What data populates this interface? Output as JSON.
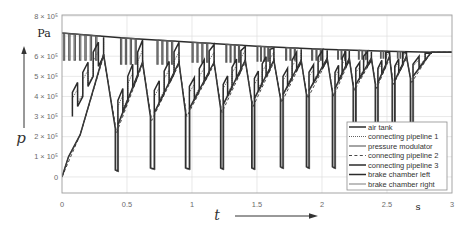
{
  "figure": {
    "y_axis": {
      "symbol": "p",
      "unit": "Pa"
    },
    "x_axis": {
      "symbol": "t",
      "unit": "s"
    }
  },
  "chart_data": {
    "type": "line",
    "title": "",
    "xlabel": "t",
    "xunit": "s",
    "ylabel": "p",
    "yunit": "Pa",
    "xlim": [
      0,
      3
    ],
    "ylim": [
      -0.8,
      8.05
    ],
    "y_multiplier": 100000,
    "xticks": [
      0,
      0.5,
      1,
      1.5,
      2,
      2.5,
      3
    ],
    "xtick_labels": [
      "0",
      "0.5",
      "1",
      "1.5",
      "2",
      "2.5",
      "3"
    ],
    "yticks": [
      0,
      1,
      2,
      3,
      4,
      5,
      6,
      7,
      8
    ],
    "ytick_labels": [
      "0",
      "1 × 10⁵",
      "2 × 10⁵",
      "3 × 10⁵",
      "4 × 10⁵",
      "5 × 10⁵",
      "6 × 10⁵",
      "",
      "8 × 10⁵"
    ],
    "grid": true,
    "legend_position": "lower right",
    "series": [
      {
        "name": "air tank",
        "line_style": "solid-thick",
        "kind": "line",
        "x": [
          0,
          0.5,
          1,
          1.5,
          2,
          2.5,
          2.85,
          3
        ],
        "y": [
          7.15,
          6.9,
          6.7,
          6.5,
          6.35,
          6.25,
          6.2,
          6.2
        ]
      },
      {
        "name": "connecting pipeline 1",
        "line_style": "dotted",
        "kind": "ladder",
        "ladders": [
          [
            0.08,
            3.2,
            0.32,
            6.0,
            6,
            0.7
          ],
          [
            0.43,
            2.8,
            0.62,
            5.6,
            5,
            0.7
          ],
          [
            0.71,
            3.4,
            0.9,
            5.6,
            5,
            0.6
          ],
          [
            0.98,
            3.6,
            1.17,
            5.6,
            5,
            0.6
          ],
          [
            1.24,
            3.8,
            1.41,
            5.7,
            5,
            0.6
          ],
          [
            1.48,
            4.1,
            1.63,
            5.7,
            5,
            0.5
          ],
          [
            1.7,
            4.3,
            1.84,
            5.7,
            4,
            0.5
          ],
          [
            1.9,
            4.5,
            2.04,
            5.8,
            4,
            0.5
          ],
          [
            2.1,
            4.6,
            2.21,
            5.8,
            4,
            0.4
          ],
          [
            2.26,
            4.8,
            2.38,
            5.8,
            4,
            0.4
          ],
          [
            2.43,
            4.9,
            2.52,
            5.9,
            3,
            0.4
          ],
          [
            2.56,
            5.0,
            2.65,
            5.9,
            3,
            0.4
          ],
          [
            2.7,
            5.2,
            2.84,
            6.2,
            3,
            0.3
          ]
        ]
      },
      {
        "name": "pressure modulator",
        "line_style": "solid",
        "kind": "pulses",
        "pulses": [
          [
            0.01,
            0.3,
            7,
            5.8
          ],
          [
            0.45,
            0.6,
            4,
            5.6
          ],
          [
            0.73,
            0.88,
            4,
            5.6
          ],
          [
            1.0,
            1.15,
            4,
            5.7
          ],
          [
            1.26,
            1.39,
            4,
            5.7
          ],
          [
            1.5,
            1.61,
            4,
            5.75
          ],
          [
            1.72,
            1.82,
            3,
            5.8
          ],
          [
            1.92,
            2.02,
            3,
            5.8
          ],
          [
            2.12,
            2.2,
            3,
            5.85
          ],
          [
            2.28,
            2.36,
            3,
            5.85
          ],
          [
            2.45,
            2.51,
            3,
            5.9
          ],
          [
            2.58,
            2.64,
            3,
            5.9
          ]
        ]
      },
      {
        "name": "connecting pipeline 2",
        "line_style": "dashed",
        "kind": "line",
        "x": [
          0,
          0.14,
          0.32,
          0.42,
          0.62,
          0.69,
          0.9,
          0.96,
          1.17,
          1.23,
          1.41,
          1.47,
          1.63,
          1.69,
          1.84,
          1.89,
          2.04,
          2.09,
          2.21,
          2.25,
          2.38,
          2.42,
          2.52,
          2.55,
          2.65,
          2.69,
          2.84,
          3.0
        ],
        "y": [
          0,
          2.1,
          6.0,
          2.2,
          5.6,
          2.8,
          5.6,
          3.0,
          5.6,
          3.2,
          5.7,
          3.5,
          5.7,
          3.7,
          5.7,
          3.9,
          5.8,
          4.0,
          5.8,
          4.3,
          5.8,
          4.4,
          5.9,
          4.6,
          5.9,
          4.7,
          6.2,
          6.2
        ]
      },
      {
        "name": "connecting pipeline 3",
        "line_style": "solid-thick",
        "kind": "ladder",
        "ladders": [
          [
            0.08,
            3.0,
            0.32,
            6.0,
            6,
            1.2
          ],
          [
            0.43,
            2.6,
            0.62,
            5.6,
            5,
            1.2
          ],
          [
            0.71,
            3.2,
            0.9,
            5.6,
            5,
            1.1
          ],
          [
            0.98,
            3.4,
            1.17,
            5.6,
            5,
            1.1
          ],
          [
            1.24,
            3.6,
            1.41,
            5.7,
            5,
            1.0
          ],
          [
            1.48,
            3.9,
            1.63,
            5.7,
            5,
            1.0
          ],
          [
            1.7,
            4.1,
            1.84,
            5.7,
            4,
            0.9
          ],
          [
            1.9,
            4.3,
            2.04,
            5.8,
            4,
            0.9
          ],
          [
            2.1,
            4.4,
            2.21,
            5.8,
            4,
            0.8
          ],
          [
            2.26,
            4.6,
            2.38,
            5.8,
            4,
            0.8
          ],
          [
            2.43,
            4.7,
            2.52,
            5.9,
            3,
            0.7
          ],
          [
            2.56,
            4.8,
            2.65,
            5.9,
            3,
            0.7
          ],
          [
            2.7,
            5.0,
            2.84,
            6.2,
            3,
            0.6
          ]
        ]
      },
      {
        "name": "brake chamber left",
        "line_style": "solid-thick",
        "kind": "line",
        "x": [
          0,
          0.05,
          0.14,
          0.32,
          0.41,
          0.41,
          0.43,
          0.43,
          0.62,
          0.68,
          0.68,
          0.71,
          0.71,
          0.9,
          0.95,
          0.95,
          0.98,
          0.98,
          1.17,
          1.22,
          1.22,
          1.24,
          1.24,
          1.41,
          1.46,
          1.46,
          1.48,
          1.48,
          1.63,
          1.68,
          1.68,
          1.7,
          1.7,
          1.84,
          1.88,
          1.88,
          1.9,
          1.9,
          2.04,
          2.08,
          2.08,
          2.1,
          2.1,
          2.21,
          2.24,
          2.24,
          2.26,
          2.26,
          2.38,
          2.41,
          2.41,
          2.43,
          2.43,
          2.52,
          2.54,
          2.54,
          2.56,
          2.56,
          2.65,
          2.68,
          2.68,
          2.7,
          2.7,
          2.84,
          3.0
        ],
        "y": [
          0,
          1.0,
          2.1,
          6.1,
          2.4,
          0.35,
          0.3,
          2.6,
          5.7,
          3.0,
          0.45,
          0.4,
          3.2,
          5.7,
          3.2,
          0.45,
          0.4,
          3.4,
          5.7,
          3.4,
          0.45,
          0.4,
          3.6,
          5.8,
          3.7,
          0.45,
          0.4,
          3.9,
          5.8,
          3.9,
          0.5,
          0.45,
          4.1,
          5.8,
          4.1,
          0.5,
          0.45,
          4.3,
          5.9,
          4.2,
          0.5,
          0.45,
          4.4,
          5.9,
          4.5,
          0.5,
          0.45,
          4.6,
          5.9,
          4.6,
          0.5,
          0.45,
          4.7,
          6.0,
          4.8,
          0.5,
          0.45,
          4.8,
          6.0,
          4.9,
          0.5,
          0.45,
          5.0,
          6.2,
          6.2
        ]
      },
      {
        "name": "brake chamber right",
        "line_style": "solid-thin",
        "kind": "line",
        "x": [
          0,
          0.05,
          0.14,
          0.32,
          0.415,
          0.415,
          0.435,
          0.435,
          0.62,
          0.685,
          0.685,
          0.715,
          0.715,
          0.9,
          0.955,
          0.955,
          0.985,
          0.985,
          1.17,
          1.225,
          1.225,
          1.245,
          1.245,
          1.41,
          1.465,
          1.465,
          1.485,
          1.485,
          1.63,
          1.685,
          1.685,
          1.705,
          1.705,
          1.84,
          1.885,
          1.885,
          1.905,
          1.905,
          2.04,
          2.085,
          2.085,
          2.105,
          2.105,
          2.21,
          2.245,
          2.245,
          2.265,
          2.265,
          2.38,
          2.415,
          2.415,
          2.435,
          2.435,
          2.52,
          2.545,
          2.545,
          2.565,
          2.565,
          2.65,
          2.685,
          2.685,
          2.705,
          2.705,
          2.84,
          3.0
        ],
        "y": [
          0,
          1.0,
          2.1,
          6.1,
          2.3,
          0.3,
          0.25,
          2.6,
          5.7,
          2.9,
          0.4,
          0.35,
          3.2,
          5.7,
          3.1,
          0.4,
          0.35,
          3.4,
          5.7,
          3.3,
          0.4,
          0.35,
          3.6,
          5.8,
          3.6,
          0.4,
          0.35,
          3.9,
          5.8,
          3.8,
          0.45,
          0.4,
          4.1,
          5.8,
          4.0,
          0.45,
          0.4,
          4.3,
          5.9,
          4.1,
          0.45,
          0.4,
          4.4,
          5.9,
          4.4,
          0.45,
          0.4,
          4.6,
          5.9,
          4.5,
          0.45,
          0.4,
          4.7,
          6.0,
          4.7,
          0.45,
          0.4,
          4.8,
          6.0,
          4.8,
          0.45,
          0.4,
          5.0,
          6.2,
          6.2
        ]
      }
    ]
  }
}
